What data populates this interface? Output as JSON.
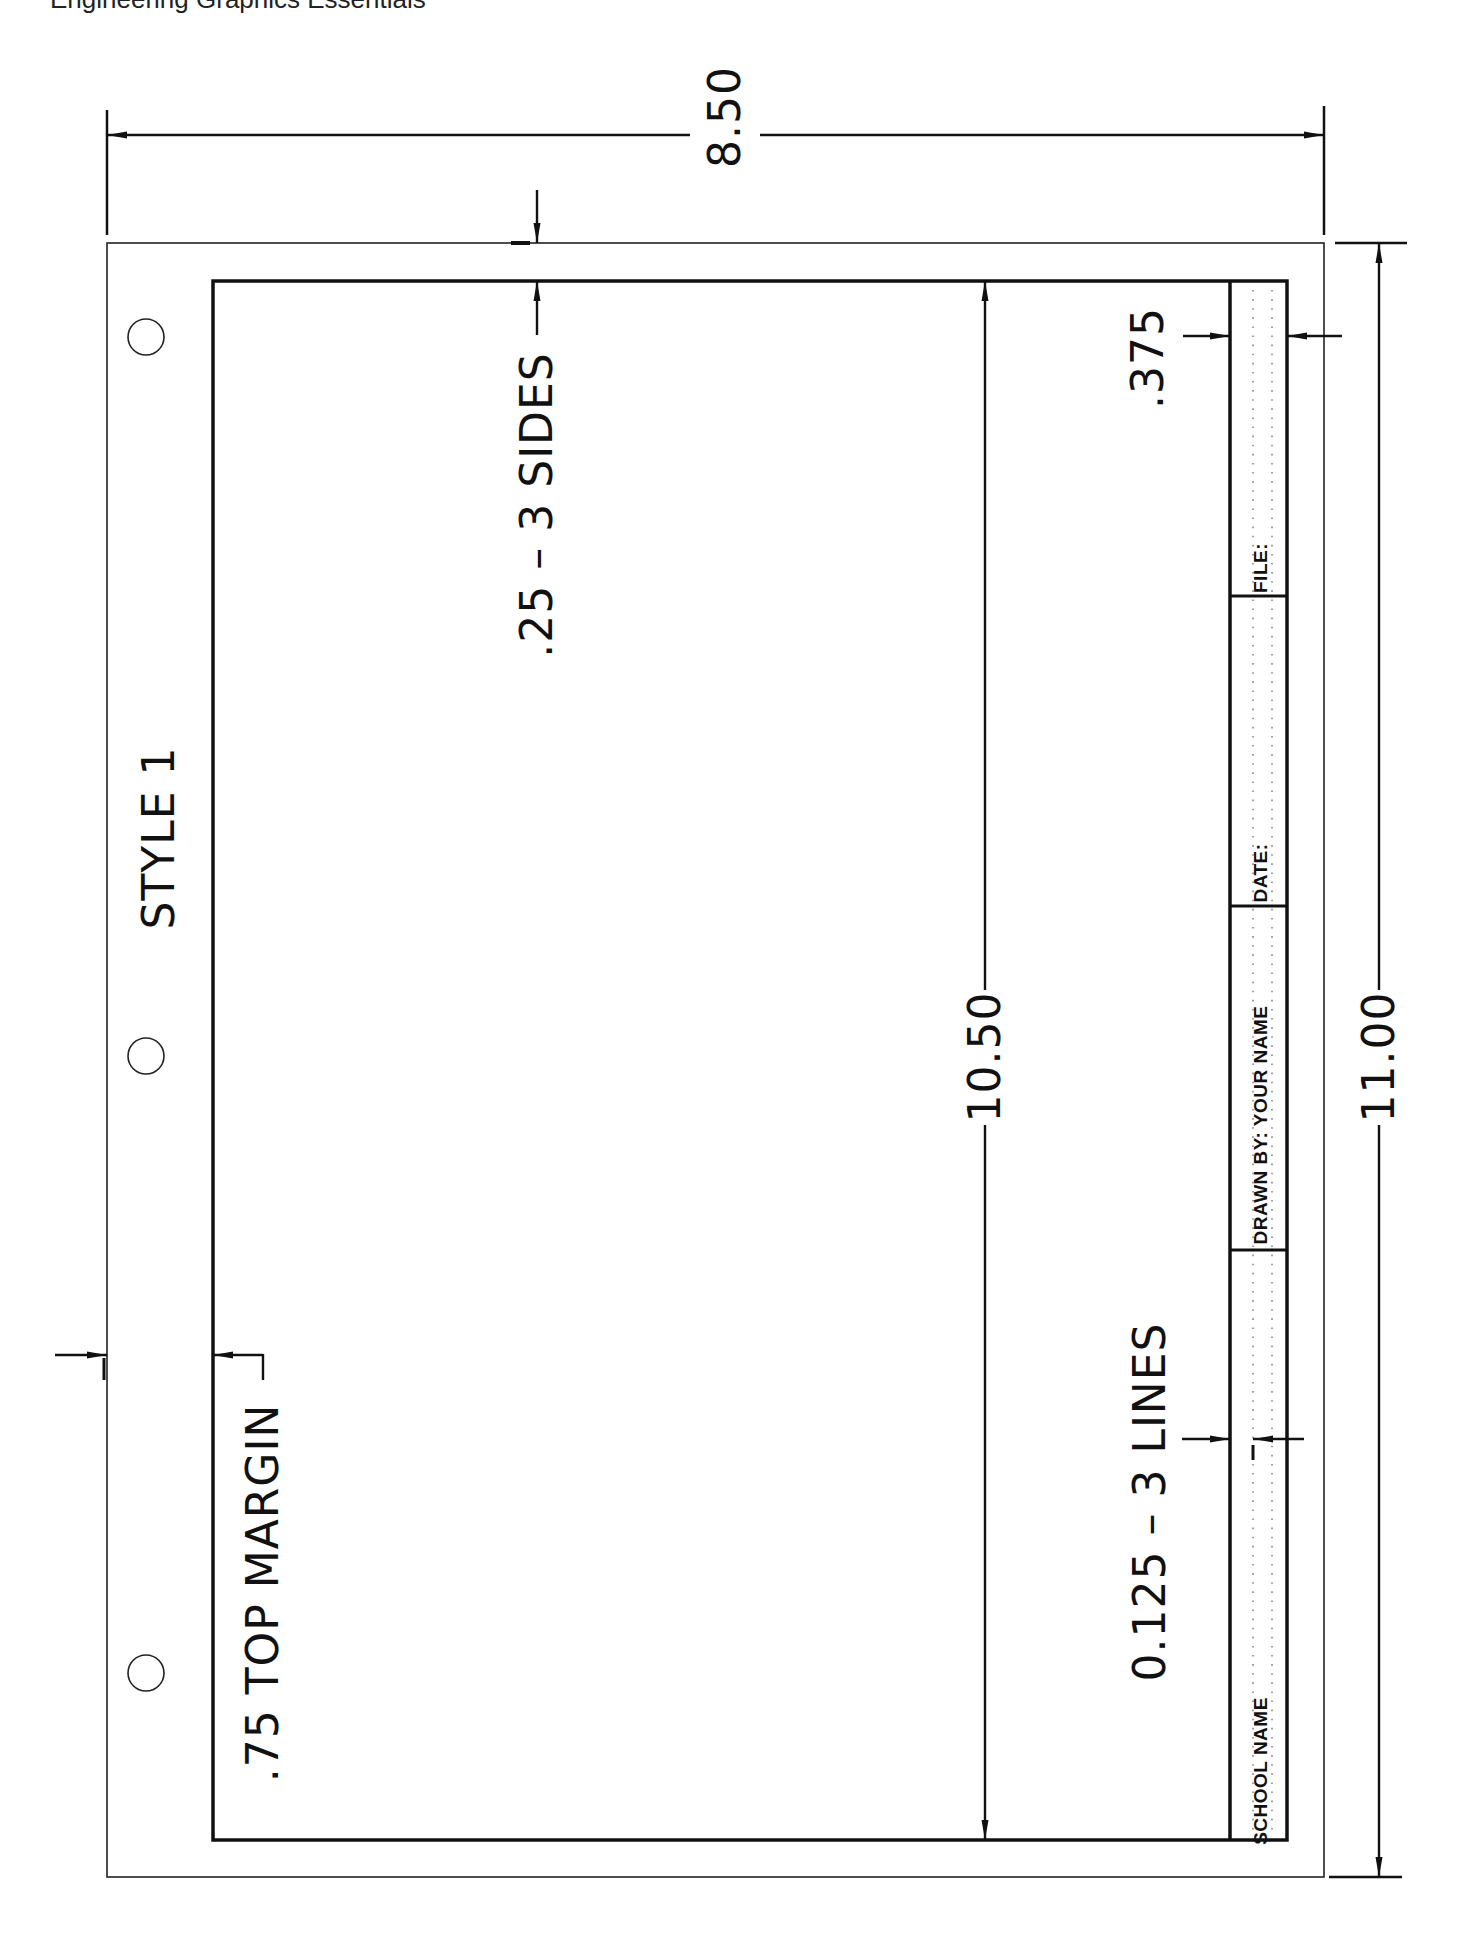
{
  "caption": "Engineering Graphics Essentials",
  "sheet": {
    "style_label": "STYLE 1",
    "punch_holes": 3
  },
  "dimensions": {
    "width": "8.50",
    "height": "11.00",
    "border_height": "10.50",
    "side_margin": ".25  –  3 SIDES",
    "top_margin": ".75 TOP MARGIN",
    "title_block_width": ".375",
    "title_line_spacing": "0.125  –  3 LINES"
  },
  "title_block": {
    "cells": [
      {
        "label": "SCHOOL NAME"
      },
      {
        "label": "DRAWN BY:  YOUR NAME"
      },
      {
        "label": "DATE:"
      },
      {
        "label": "FILE:"
      }
    ]
  },
  "colors": {
    "ink": "#111111",
    "paper": "#ffffff",
    "dots": "#888888"
  }
}
